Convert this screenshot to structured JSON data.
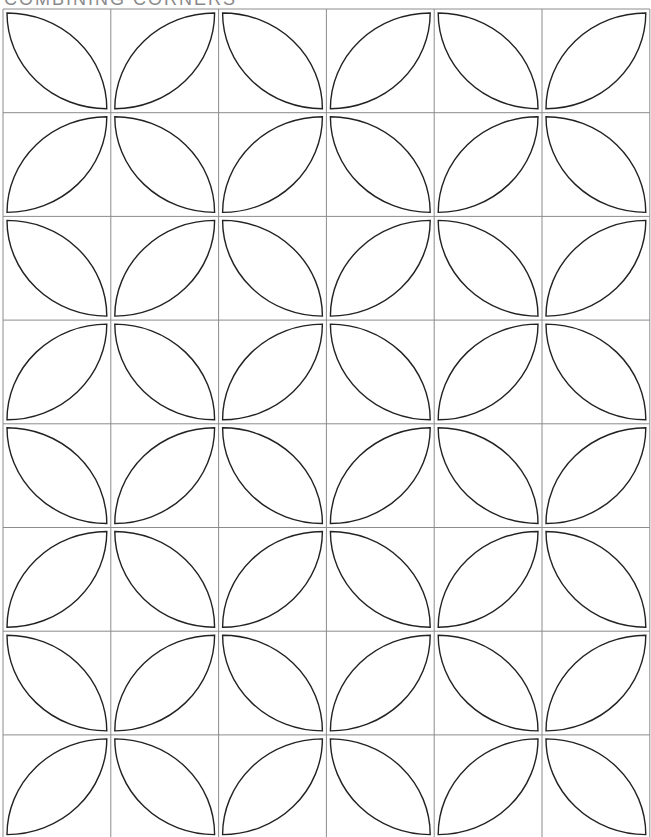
{
  "title": "COMBINING CORNERS",
  "pattern": {
    "name": "orange-peel-quilt-block",
    "columns": 6,
    "rows": 8,
    "origin_x": 3,
    "origin_y": 9,
    "cell_width": 107.8,
    "cell_height": 103.7,
    "petal_inset": 4,
    "grid_color": "#8c8c8c",
    "petal_stroke_color": "#222222",
    "orientation_rule": "(row+col) even: top-left to bottom-right; odd: top-right to bottom-left"
  }
}
